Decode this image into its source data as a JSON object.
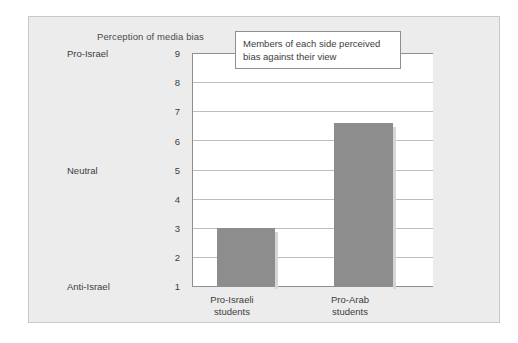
{
  "chart_data": {
    "type": "bar",
    "title": "Perception of media bias",
    "xlabel": "",
    "ylabel": "",
    "categories": [
      "Pro-Israeli students",
      "Pro-Arab students"
    ],
    "values": [
      3.0,
      6.6
    ],
    "ylim": [
      1,
      9
    ],
    "yticks": [
      1,
      2,
      3,
      4,
      5,
      6,
      7,
      8,
      9
    ],
    "ytick_labels": [
      "1",
      "2",
      "3",
      "4",
      "5",
      "6",
      "7",
      "8",
      "9"
    ],
    "y_named_ticks": [
      {
        "value": 9,
        "label": "Pro-Israel"
      },
      {
        "value": 5,
        "label": "Neutral"
      },
      {
        "value": 1,
        "label": "Anti-Israel"
      }
    ],
    "grid": true,
    "legend": false,
    "annotations": [
      {
        "text": "Members of each side perceived bias against their view",
        "line1": "Members of each side perceived",
        "line2": "bias against their view"
      }
    ],
    "colors": {
      "bar_fill": "#8d8d8d",
      "plot_background": "#ffffff",
      "chart_background": "#ececec",
      "gridline": "#bdbdbd",
      "axis": "#8f8f8f",
      "text": "#3d3d3d"
    }
  },
  "axis": {
    "y_numbers": [
      "9",
      "8",
      "7",
      "6",
      "5",
      "4",
      "3",
      "2",
      "1"
    ],
    "y_top_label": "Pro-Israel",
    "y_mid_label": "Neutral",
    "y_bottom_label": "Anti-Israel"
  },
  "categories": {
    "cat1_line1": "Pro-Israeli",
    "cat1_line2": "students",
    "cat2_line1": "Pro-Arab",
    "cat2_line2": "students"
  },
  "callout": {
    "line1": "Members of each side perceived",
    "line2": "bias against their view"
  }
}
